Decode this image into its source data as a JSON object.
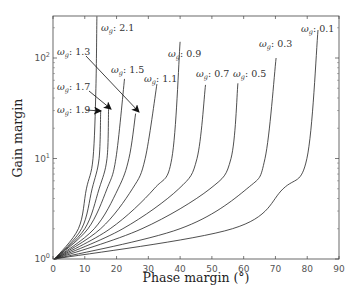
{
  "chart_data": {
    "type": "line",
    "title": "",
    "xlabel": "Phase margin (°)",
    "ylabel": "Gain margin",
    "xlim": [
      0,
      90
    ],
    "ylim": [
      1,
      260
    ],
    "yscale": "log",
    "grid": false,
    "legend": "none (inline labels)",
    "x_ticks": [
      "0",
      "10",
      "20",
      "30",
      "40",
      "50",
      "60",
      "70",
      "80",
      "90"
    ],
    "y_ticks": [
      {
        "base": "10",
        "exp": "0",
        "value": 1
      },
      {
        "base": "10",
        "exp": "1",
        "value": 10
      },
      {
        "base": "10",
        "exp": "2",
        "value": 100
      }
    ],
    "series": [
      {
        "name": "ωg: 2.1",
        "symbol": "ω",
        "sub": "g",
        "value": "2.1",
        "points": [
          [
            0.5,
            1
          ],
          [
            8,
            2
          ],
          [
            10.5,
            5
          ],
          [
            12.6,
            10
          ],
          [
            13.5,
            50
          ],
          [
            13.8,
            260
          ]
        ],
        "label_pos": [
          101,
          31
        ],
        "arrow": null
      },
      {
        "name": "ωg: 1.9",
        "symbol": "ω",
        "sub": "g",
        "value": "1.9",
        "points": [
          [
            0.5,
            1
          ],
          [
            9,
            2
          ],
          [
            12.3,
            5
          ],
          [
            14.5,
            10
          ],
          [
            15,
            30
          ]
        ],
        "label_pos": [
          57,
          113
        ],
        "arrow": [
          [
            86,
            110
          ],
          [
            101,
            111
          ]
        ]
      },
      {
        "name": "ωg: 1.7",
        "symbol": "ω",
        "sub": "g",
        "value": "1.7",
        "points": [
          [
            0.5,
            1
          ],
          [
            10,
            2
          ],
          [
            14.5,
            5
          ],
          [
            17,
            10
          ],
          [
            17.5,
            32
          ]
        ],
        "label_pos": [
          57,
          90
        ],
        "arrow": [
          [
            89,
            91
          ],
          [
            111,
            109
          ]
        ]
      },
      {
        "name": "ωg: 1.5",
        "symbol": "ω",
        "sub": "g",
        "value": "1.5",
        "points": [
          [
            0.5,
            1
          ],
          [
            11,
            2
          ],
          [
            17,
            5
          ],
          [
            19.8,
            10
          ],
          [
            22.5,
            62
          ]
        ],
        "label_pos": [
          111,
          73
        ],
        "arrow": null
      },
      {
        "name": "ωg: 1.3",
        "symbol": "ω",
        "sub": "g",
        "value": "1.3",
        "points": [
          [
            0.5,
            1
          ],
          [
            13,
            2
          ],
          [
            20.5,
            5
          ],
          [
            23.9,
            10
          ],
          [
            26,
            28
          ]
        ],
        "label_pos": [
          57,
          55
        ],
        "arrow": [
          [
            86,
            56
          ],
          [
            139,
            112
          ]
        ]
      },
      {
        "name": "ωg: 1.1",
        "symbol": "ω",
        "sub": "g",
        "value": "1.1",
        "points": [
          [
            0.5,
            1
          ],
          [
            15,
            2
          ],
          [
            25,
            5
          ],
          [
            29,
            10
          ],
          [
            32.7,
            55
          ]
        ],
        "label_pos": [
          144,
          82
        ],
        "arrow": null
      },
      {
        "name": "ωg: 0.9",
        "symbol": "ω",
        "sub": "g",
        "value": "0.9",
        "points": [
          [
            0.5,
            1
          ],
          [
            18,
            2
          ],
          [
            31.8,
            5
          ],
          [
            37.4,
            10
          ],
          [
            40,
            145
          ]
        ],
        "label_pos": [
          168,
          57
        ],
        "arrow": null
      },
      {
        "name": "ωg: 0.7",
        "symbol": "ω",
        "sub": "g",
        "value": "0.7",
        "points": [
          [
            0.5,
            1
          ],
          [
            22,
            2
          ],
          [
            39.6,
            5
          ],
          [
            45.3,
            10
          ],
          [
            48,
            54
          ]
        ],
        "label_pos": [
          196,
          77
        ],
        "arrow": null
      },
      {
        "name": "ωg: 0.5",
        "symbol": "ω",
        "sub": "g",
        "value": "0.5",
        "points": [
          [
            0.5,
            1
          ],
          [
            28,
            2
          ],
          [
            49.4,
            5
          ],
          [
            56,
            10
          ],
          [
            58.2,
            56
          ]
        ],
        "label_pos": [
          233,
          77
        ],
        "arrow": null
      },
      {
        "name": "ωg: 0.3",
        "symbol": "ω",
        "sub": "g",
        "value": "0.3",
        "points": [
          [
            0.5,
            1
          ],
          [
            40,
            2
          ],
          [
            61,
            5
          ],
          [
            66.7,
            10
          ],
          [
            70.2,
            100
          ]
        ],
        "label_pos": [
          259,
          47
        ],
        "arrow": null
      },
      {
        "name": "ωg: 0.1",
        "symbol": "ω",
        "sub": "g",
        "value": "0.1",
        "points": [
          [
            0.5,
            1
          ],
          [
            56.5,
            2
          ],
          [
            72.4,
            5
          ],
          [
            79.9,
            10
          ],
          [
            83.4,
            190
          ]
        ],
        "label_pos": [
          301,
          32
        ],
        "arrow": null
      }
    ]
  }
}
